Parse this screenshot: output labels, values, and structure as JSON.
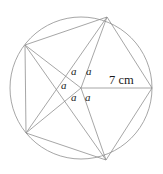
{
  "figure": {
    "canvas": {
      "width": 163,
      "height": 174
    },
    "background_color": "#ffffff",
    "stroke_color": "#8f8f8f",
    "text_color": "#1a1a1a",
    "stroke_width": 0.8,
    "circle": {
      "cx": 81,
      "cy": 88,
      "r": 71
    },
    "center_point": {
      "cx": 81,
      "cy": 88
    },
    "vertices": [
      {
        "name": "vertex-right",
        "x": 152,
        "y": 88
      },
      {
        "name": "vertex-bottom",
        "x": 106,
        "y": 160
      },
      {
        "name": "vertex-lower-left",
        "x": 26,
        "y": 133
      },
      {
        "name": "vertex-upper-left",
        "x": 25,
        "y": 45
      },
      {
        "name": "vertex-top",
        "x": 107,
        "y": 17
      }
    ],
    "polygon_points": "152,88 106,160 26,133 25,45 107,17",
    "radii": [
      {
        "name": "radius-to-right",
        "x1": 81,
        "y1": 88,
        "x2": 152,
        "y2": 88
      },
      {
        "name": "radius-to-bottom",
        "x1": 81,
        "y1": 88,
        "x2": 106,
        "y2": 160
      },
      {
        "name": "radius-to-lower-left",
        "x1": 81,
        "y1": 88,
        "x2": 26,
        "y2": 133
      },
      {
        "name": "radius-to-upper-left",
        "x1": 81,
        "y1": 88,
        "x2": 25,
        "y2": 45
      },
      {
        "name": "radius-to-top",
        "x1": 81,
        "y1": 88,
        "x2": 107,
        "y2": 17
      }
    ],
    "chords": [
      {
        "name": "chord-top-to-lower-left",
        "x1": 107,
        "y1": 17,
        "x2": 26,
        "y2": 133
      },
      {
        "name": "chord-upper-left-to-bottom",
        "x1": 25,
        "y1": 45,
        "x2": 106,
        "y2": 160
      }
    ]
  },
  "labels": {
    "angles": [
      {
        "id": "angle-a-upper-left",
        "text": "a",
        "x": 71,
        "y": 66
      },
      {
        "id": "angle-a-upper-right",
        "text": "a",
        "x": 86,
        "y": 66
      },
      {
        "id": "angle-a-left",
        "text": "a",
        "x": 61,
        "y": 80
      },
      {
        "id": "angle-a-lower-left",
        "text": "a",
        "x": 71,
        "y": 92
      },
      {
        "id": "angle-a-lower-right",
        "text": "a",
        "x": 85,
        "y": 92
      }
    ],
    "measurement": {
      "id": "radius-measure",
      "text": "7 cm",
      "x": 109,
      "y": 74
    }
  }
}
